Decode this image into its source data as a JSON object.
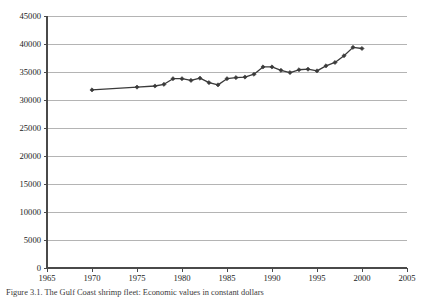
{
  "figure": {
    "caption": "Figure 3.1. The Gulf Coast shrimp fleet: Economic values in constant dollars"
  },
  "chart_data": {
    "type": "line",
    "title": "",
    "xlabel": "",
    "ylabel": "",
    "xlim": [
      1965,
      2005
    ],
    "ylim": [
      0,
      45000
    ],
    "xticks": [
      1965,
      1970,
      1975,
      1980,
      1985,
      1990,
      1995,
      2000,
      2005
    ],
    "yticks": [
      0,
      5000,
      10000,
      15000,
      20000,
      25000,
      30000,
      35000,
      40000,
      45000
    ],
    "grid": "horizontal",
    "legend": "none",
    "marker": "diamond",
    "line_color": "#3a3a3a",
    "grid_color": "#b4b4b4",
    "axis_color": "#4a4a4a",
    "x": [
      1970,
      1975,
      1977,
      1978,
      1979,
      1980,
      1981,
      1982,
      1983,
      1984,
      1985,
      1986,
      1987,
      1988,
      1989,
      1990,
      1991,
      1992,
      1993,
      1994,
      1995,
      1996,
      1997,
      1998,
      1999,
      2000
    ],
    "values": [
      31800,
      32300,
      32500,
      32800,
      33800,
      33800,
      33500,
      33900,
      33100,
      32700,
      33800,
      34000,
      34100,
      34600,
      35900,
      35900,
      35300,
      34900,
      35400,
      35500,
      35200,
      36100,
      36700,
      37900,
      39400,
      39200
    ],
    "series": [
      {
        "name": "value",
        "values": [
          31800,
          32300,
          32500,
          32800,
          33800,
          33800,
          33500,
          33900,
          33100,
          32700,
          33800,
          34000,
          34100,
          34600,
          35900,
          35900,
          35300,
          34900,
          35400,
          35500,
          35200,
          36100,
          36700,
          37900,
          39400,
          39200
        ]
      }
    ]
  }
}
